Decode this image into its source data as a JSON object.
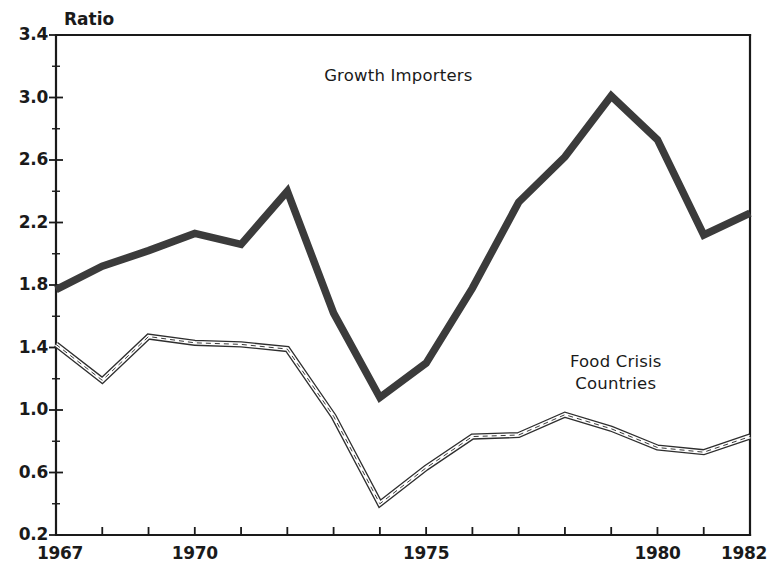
{
  "chart_data": {
    "type": "line",
    "title": "",
    "subtitle": "",
    "xlabel": "",
    "ylabel": "Ratio",
    "unit_label": "Ratio",
    "grid": false,
    "legend_position": "inline-annotation",
    "xlim": [
      1967,
      1982
    ],
    "ylim": [
      0.2,
      3.4
    ],
    "x": [
      1967,
      1968,
      1969,
      1970,
      1971,
      1972,
      1973,
      1974,
      1975,
      1976,
      1977,
      1978,
      1979,
      1980,
      1981,
      1982
    ],
    "xticks_labeled": [
      "1967",
      "1970",
      "1975",
      "1980",
      "1982"
    ],
    "xticks_labeled_values": [
      1967,
      1970,
      1975,
      1980,
      1982
    ],
    "xticks_all_values": [
      1967,
      1968,
      1969,
      1970,
      1971,
      1972,
      1973,
      1974,
      1975,
      1976,
      1977,
      1978,
      1979,
      1980,
      1981,
      1982
    ],
    "yticks": [
      "3.4",
      "3.0",
      "2.6",
      "2.2",
      "1.8",
      "1.4",
      "1.0",
      "0.6",
      "0.2"
    ],
    "ytick_values": [
      3.4,
      3.0,
      2.6,
      2.2,
      1.8,
      1.4,
      1.0,
      0.6,
      0.2
    ],
    "yminor_values": [
      3.2,
      2.8,
      2.4,
      2.0,
      1.6,
      1.2,
      0.8,
      0.4
    ],
    "series": [
      {
        "name": "Growth Importers",
        "style": "thick-solid",
        "color": "#3b3b3b",
        "label_x": 1974.4,
        "label_y": 3.14,
        "values": [
          1.77,
          1.92,
          2.02,
          2.13,
          2.06,
          2.4,
          1.62,
          1.08,
          1.3,
          1.78,
          2.33,
          2.62,
          3.01,
          2.73,
          2.12,
          2.26
        ]
      },
      {
        "name": "Food Crisis Countries",
        "name_line1": "Food Crisis",
        "name_line2": "Countries",
        "style": "thin-double-dashed",
        "color": "#2e2e2e",
        "label_x": 1979.1,
        "label_y": 1.3,
        "values": [
          1.42,
          1.19,
          1.47,
          1.43,
          1.42,
          1.39,
          0.96,
          0.4,
          0.63,
          0.83,
          0.84,
          0.97,
          0.88,
          0.76,
          0.73,
          0.83
        ]
      }
    ],
    "annotations": [
      {
        "text": "Growth Importers",
        "x": 1974.4,
        "y": 3.14
      },
      {
        "text": "Food Crisis Countries",
        "x": 1979.1,
        "y": 1.3
      }
    ]
  }
}
